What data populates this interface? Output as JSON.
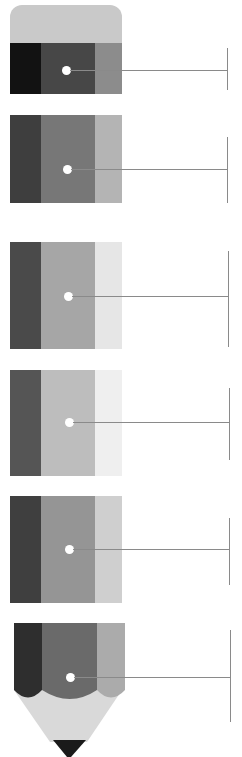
{
  "diagram": {
    "type": "pencil-infographic",
    "background": "#ffffff",
    "eraser": {
      "color": "#c9c9c9"
    },
    "segments": [
      {
        "index": 1,
        "top": 43,
        "height": 51,
        "colors": [
          "#121212",
          "#474747",
          "#8c8c8c"
        ],
        "dot_y": 70,
        "dot_x": 66,
        "bracket": {
          "x": 227,
          "top": 48,
          "bottom": 90
        }
      },
      {
        "index": 2,
        "top": 115,
        "height": 88,
        "colors": [
          "#3e3e3e",
          "#777777",
          "#b4b4b4"
        ],
        "dot_y": 169,
        "dot_x": 67,
        "bracket": {
          "x": 227,
          "top": 137,
          "bottom": 203
        }
      },
      {
        "index": 3,
        "top": 242,
        "height": 107,
        "colors": [
          "#4a4a4a",
          "#a6a6a6",
          "#e6e6e6"
        ],
        "dot_y": 296,
        "dot_x": 68,
        "bracket": {
          "x": 228,
          "top": 251,
          "bottom": 347
        }
      },
      {
        "index": 4,
        "top": 370,
        "height": 106,
        "colors": [
          "#555555",
          "#bdbdbd",
          "#efefef"
        ],
        "dot_y": 422,
        "dot_x": 69,
        "bracket": {
          "x": 229,
          "top": 388,
          "bottom": 460
        }
      },
      {
        "index": 5,
        "top": 496,
        "height": 107,
        "colors": [
          "#3f3f3f",
          "#959595",
          "#cfcfcf"
        ],
        "dot_y": 549,
        "dot_x": 69,
        "bracket": {
          "x": 229,
          "top": 518,
          "bottom": 585
        }
      },
      {
        "index": 6,
        "top": 623,
        "height": 67,
        "colors": [
          "#2e2e2e",
          "#6a6a6a",
          "#ababab"
        ],
        "dot_y": 677,
        "dot_x": 70,
        "bracket": {
          "x": 230,
          "top": 630,
          "bottom": 722
        }
      }
    ],
    "wood": {
      "color": "#d9d9d9",
      "top": 690,
      "tip_top": 740
    },
    "lead": {
      "color": "#1a1a1a"
    },
    "connector_color": "#8a8a8a",
    "labels": []
  }
}
